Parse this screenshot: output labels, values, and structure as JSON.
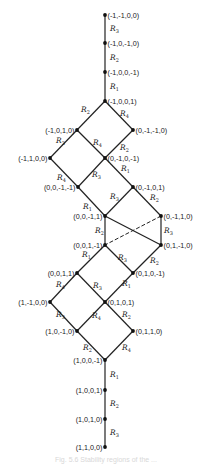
{
  "diagram": {
    "line_color": "#222222",
    "node_color": "#111111",
    "nodes": [
      {
        "id": "n1",
        "label": "(-1,-1,0,0)",
        "x": 105,
        "y": 15,
        "anchor": "right"
      },
      {
        "id": "n2",
        "label": "(-1,0,-1,0)",
        "x": 105,
        "y": 43,
        "anchor": "right"
      },
      {
        "id": "n3",
        "label": "(-1,0,0,-1)",
        "x": 105,
        "y": 72,
        "anchor": "right"
      },
      {
        "id": "n4",
        "label": "(-1,0,0,1)",
        "x": 105,
        "y": 101,
        "anchor": "right"
      },
      {
        "id": "n5",
        "label": "(-1,0,1,0)",
        "x": 77,
        "y": 130,
        "anchor": "left"
      },
      {
        "id": "n6",
        "label": "(0,-1,-1,0)",
        "x": 133,
        "y": 130,
        "anchor": "right"
      },
      {
        "id": "n7",
        "label": "(-1,1,0,0)",
        "x": 50,
        "y": 158,
        "anchor": "left"
      },
      {
        "id": "n8",
        "label": "(0,-1,0,-1)",
        "x": 105,
        "y": 158,
        "anchor": "right"
      },
      {
        "id": "n9",
        "label": "(0,0,-1,-1)",
        "x": 78,
        "y": 187,
        "anchor": "left"
      },
      {
        "id": "n10",
        "label": "(0,-1,0,1)",
        "x": 133,
        "y": 187,
        "anchor": "right"
      },
      {
        "id": "n11",
        "label": "(0,0,-1,1)",
        "x": 105,
        "y": 216,
        "anchor": "left"
      },
      {
        "id": "n12",
        "label": "(0,-1,1,0)",
        "x": 161,
        "y": 216,
        "anchor": "right"
      },
      {
        "id": "n13",
        "label": "(0,0,1,-1)",
        "x": 105,
        "y": 245,
        "anchor": "left"
      },
      {
        "id": "n14",
        "label": "(0,1,-1,0)",
        "x": 161,
        "y": 245,
        "anchor": "right"
      },
      {
        "id": "n15",
        "label": "(0,0,1,1)",
        "x": 77,
        "y": 273,
        "anchor": "left"
      },
      {
        "id": "n16",
        "label": "(0,1,0,-1)",
        "x": 133,
        "y": 273,
        "anchor": "right"
      },
      {
        "id": "n17",
        "label": "(1,-1,0,0)",
        "x": 50,
        "y": 302,
        "anchor": "left"
      },
      {
        "id": "n18",
        "label": "(0,1,0,1)",
        "x": 105,
        "y": 302,
        "anchor": "right"
      },
      {
        "id": "n19",
        "label": "(1,0,-1,0)",
        "x": 77,
        "y": 331,
        "anchor": "left"
      },
      {
        "id": "n20",
        "label": "(0,1,1,0)",
        "x": 133,
        "y": 331,
        "anchor": "right"
      },
      {
        "id": "n21",
        "label": "(1,0,0,-1)",
        "x": 105,
        "y": 360,
        "anchor": "left"
      },
      {
        "id": "n22",
        "label": "(1,0,0,1)",
        "x": 105,
        "y": 390,
        "anchor": "left"
      },
      {
        "id": "n23",
        "label": "(1,0,1,0)",
        "x": 105,
        "y": 419,
        "anchor": "left"
      },
      {
        "id": "n24",
        "label": "(1,1,0,0)",
        "x": 105,
        "y": 447,
        "anchor": "left"
      }
    ],
    "edges": [
      {
        "from": "n1",
        "to": "n2",
        "label": "R",
        "sub": "3",
        "lx": 110,
        "ly": 31
      },
      {
        "from": "n2",
        "to": "n3",
        "label": "R",
        "sub": "2",
        "lx": 110,
        "ly": 60
      },
      {
        "from": "n3",
        "to": "n4",
        "label": "R",
        "sub": "1",
        "lx": 110,
        "ly": 89
      },
      {
        "from": "n4",
        "to": "n5",
        "label": "R",
        "sub": "2",
        "lx": 81,
        "ly": 112
      },
      {
        "from": "n4",
        "to": "n6",
        "label": "R",
        "sub": "4",
        "lx": 120,
        "ly": 116
      },
      {
        "from": "n5",
        "to": "n7",
        "label": "R",
        "sub": "3",
        "lx": 56,
        "ly": 143
      },
      {
        "from": "n5",
        "to": "n8",
        "label": "R",
        "sub": "4",
        "lx": 93,
        "ly": 145
      },
      {
        "from": "n6",
        "to": "n8",
        "label": "R",
        "sub": "2",
        "lx": 120,
        "ly": 150
      },
      {
        "from": "n7",
        "to": "n9",
        "label": "R",
        "sub": "4",
        "lx": 57,
        "ly": 180
      },
      {
        "from": "n8",
        "to": "n9",
        "label": "R",
        "sub": "3",
        "lx": 92,
        "ly": 177
      },
      {
        "from": "n8",
        "to": "n10",
        "label": "R",
        "sub": "1",
        "lx": 121,
        "ly": 171
      },
      {
        "from": "n9",
        "to": "n11",
        "label": "R",
        "sub": "1",
        "lx": 83,
        "ly": 209
      },
      {
        "from": "n10",
        "to": "n11",
        "label": "R",
        "sub": "3",
        "lx": 110,
        "ly": 199
      },
      {
        "from": "n10",
        "to": "n12",
        "label": "R",
        "sub": "2",
        "lx": 150,
        "ly": 200
      },
      {
        "from": "n11",
        "to": "n13",
        "label": "R",
        "sub": "2",
        "lx": 95,
        "ly": 233
      },
      {
        "from": "n12",
        "to": "n14",
        "label": "R",
        "sub": "3",
        "lx": 164,
        "ly": 233
      },
      {
        "from": "n11",
        "to": "n14",
        "label": "",
        "sub": "",
        "lx": 0,
        "ly": 0
      },
      {
        "from": "n12",
        "to": "n13",
        "label": "",
        "sub": "",
        "lx": 0,
        "ly": 0,
        "dashed": true
      },
      {
        "from": "n13",
        "to": "n15",
        "label": "R",
        "sub": "1",
        "lx": 82,
        "ly": 257
      },
      {
        "from": "n13",
        "to": "n16",
        "label": "R",
        "sub": "3",
        "lx": 118,
        "ly": 260
      },
      {
        "from": "n14",
        "to": "n16",
        "label": "R",
        "sub": "2",
        "lx": 150,
        "ly": 263
      },
      {
        "from": "n15",
        "to": "n17",
        "label": "R",
        "sub": "4",
        "lx": 56,
        "ly": 287
      },
      {
        "from": "n15",
        "to": "n18",
        "label": "R",
        "sub": "3",
        "lx": 93,
        "ly": 288
      },
      {
        "from": "n16",
        "to": "n18",
        "label": "R",
        "sub": "1",
        "lx": 122,
        "ly": 286
      },
      {
        "from": "n17",
        "to": "n19",
        "label": "R",
        "sub": "3",
        "lx": 56,
        "ly": 317
      },
      {
        "from": "n18",
        "to": "n19",
        "label": "R",
        "sub": "4",
        "lx": 92,
        "ly": 318
      },
      {
        "from": "n18",
        "to": "n20",
        "label": "R",
        "sub": "2",
        "lx": 122,
        "ly": 317
      },
      {
        "from": "n19",
        "to": "n21",
        "label": "R",
        "sub": "2",
        "lx": 83,
        "ly": 350
      },
      {
        "from": "n20",
        "to": "n21",
        "label": "R",
        "sub": "4",
        "lx": 122,
        "ly": 350
      },
      {
        "from": "n21",
        "to": "n22",
        "label": "R",
        "sub": "1",
        "lx": 110,
        "ly": 377
      },
      {
        "from": "n22",
        "to": "n23",
        "label": "R",
        "sub": "2",
        "lx": 110,
        "ly": 406
      },
      {
        "from": "n23",
        "to": "n24",
        "label": "R",
        "sub": "3",
        "lx": 110,
        "ly": 435
      }
    ]
  },
  "caption": "Fig. 5.6  Stability regions of the ..."
}
